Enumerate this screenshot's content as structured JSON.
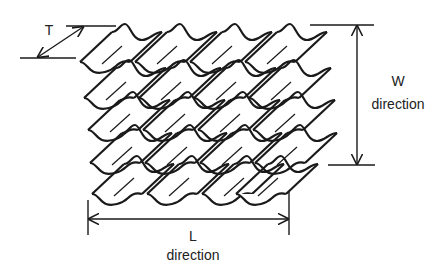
{
  "diagram": {
    "labels": {
      "t": "T",
      "w_letter": "W",
      "w_word": "direction",
      "l_letter": "L",
      "l_word": "direction"
    },
    "colors": {
      "line": "#1a1a1a",
      "background": "#ffffff"
    },
    "grid": {
      "rows": 5,
      "columns": 4
    }
  }
}
